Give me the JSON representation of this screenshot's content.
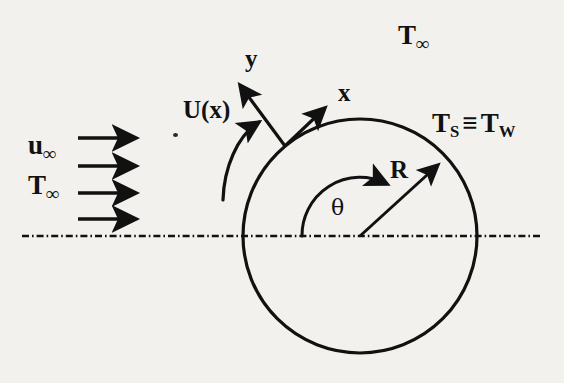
{
  "figure": {
    "background_color": "#f2f1ee",
    "ink_color": "#111111",
    "width": 564,
    "height": 383
  },
  "labels": {
    "freestream_velocity": {
      "base": "u",
      "sub": "∞",
      "text": "u∞"
    },
    "freestream_temperature_left": {
      "base": "T",
      "sub": "∞",
      "text": "T∞"
    },
    "freestream_temperature_top": {
      "base": "T",
      "sub": "∞",
      "text": "T∞"
    },
    "external_velocity": {
      "text": "U(x)"
    },
    "axis_x": {
      "text": "x"
    },
    "axis_y": {
      "text": "y"
    },
    "radius": {
      "text": "R"
    },
    "angle": {
      "text": "θ"
    },
    "surface_temperature": {
      "left_base": "T",
      "left_sub": "S",
      "relation": "≡",
      "right_base": "T",
      "right_sub": "W",
      "text": "TS ≡ TW"
    }
  },
  "geometry": {
    "cylinder": {
      "cx": 360,
      "cy": 236,
      "r": 117,
      "stroke_width": 3
    },
    "centerline": {
      "x1": 22,
      "x2": 543,
      "y": 236,
      "pattern": "dash-dot"
    },
    "inflow_arrows": [
      {
        "x1": 78,
        "x2": 143,
        "y": 138
      },
      {
        "x1": 78,
        "x2": 143,
        "y": 166
      },
      {
        "x1": 78,
        "x2": 143,
        "y": 193
      },
      {
        "x1": 78,
        "x2": 143,
        "y": 219
      }
    ],
    "boundary_layer_origin": {
      "x": 285,
      "y": 146
    },
    "axis_x_arrow": {
      "x1": 285,
      "y1": 146,
      "x2": 329,
      "y2": 104
    },
    "axis_y_arrow": {
      "x1": 285,
      "y1": 146,
      "x2": 236,
      "y2": 79
    },
    "velocity_arrow": {
      "x1": 223,
      "y1": 196,
      "x2": 265,
      "y2": 118
    },
    "radius_arrow": {
      "x1": 360,
      "y1": 236,
      "x2": 444,
      "y2": 159
    },
    "angle_arc": {
      "cx": 360,
      "cy": 236,
      "radius": 58,
      "start_deg": 180,
      "end_deg": 48
    }
  },
  "label_positions": {
    "freestream_velocity": {
      "x": 28,
      "y": 135
    },
    "freestream_temperature_left": {
      "x": 28,
      "y": 175
    },
    "freestream_temperature_top": {
      "x": 398,
      "y": 24
    },
    "external_velocity": {
      "x": 183,
      "y": 99
    },
    "axis_x": {
      "x": 337,
      "y": 80
    },
    "axis_y": {
      "x": 244,
      "y": 47
    },
    "radius": {
      "x": 389,
      "y": 158
    },
    "angle": {
      "x": 330,
      "y": 198
    },
    "surface_temperature": {
      "x": 432,
      "y": 112
    }
  }
}
